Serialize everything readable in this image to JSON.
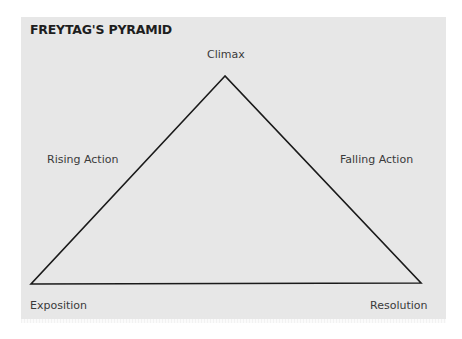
{
  "title": "FREYTAG'S PYRAMID",
  "labels": {
    "climax": "Climax",
    "rising_action": "Rising Action",
    "falling_action": "Falling Action",
    "exposition": "Exposition",
    "resolution": "Resolution"
  },
  "colors": {
    "panel_background": "#e7e7e7",
    "line": "#1a1a1a",
    "text": "#3a3a3a",
    "title": "#1e1e1e"
  },
  "triangle": {
    "apex": [
      225,
      76
    ],
    "left": [
      31,
      284
    ],
    "right": [
      421,
      283
    ]
  }
}
